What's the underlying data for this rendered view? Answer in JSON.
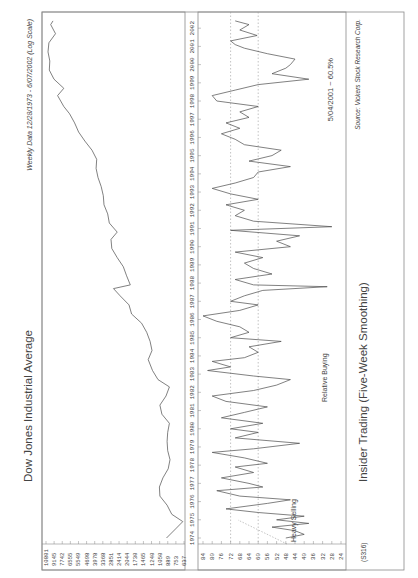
{
  "header": {
    "range_text": "Weekly Data 12/28/1973 - 6/07/2002 (Log Scale)",
    "source_text": "Source: Vickers Stock Research Corp.",
    "chart_code": "(S316)"
  },
  "colors": {
    "line": "#4a4a4a",
    "frame": "#8a8a8a",
    "grid": "#9a9a9a",
    "text": "#444444"
  },
  "chart_data": [
    {
      "type": "line",
      "title": "Dow Jones Industrial Average",
      "subtitle": "Weekly Data 12/28/1973 - 6/07/2002 (Log Scale)",
      "xlabel": "",
      "ylabel": "",
      "scale": "log",
      "ylim": [
        637,
        10801
      ],
      "y_ticks": [
        10801,
        9145,
        7742,
        6555,
        5549,
        4698,
        3978,
        3368,
        2851,
        2414,
        2044,
        1730,
        1465,
        1240,
        1050,
        889,
        753,
        637
      ],
      "x_ticks": [
        "1974",
        "1975",
        "1976",
        "1977",
        "1978",
        "1979",
        "1980",
        "1981",
        "1982",
        "1983",
        "1984",
        "1985",
        "1986",
        "1987",
        "1988",
        "1989",
        "1990",
        "1991",
        "1992",
        "1993",
        "1994",
        "1995",
        "1996",
        "1997",
        "1998",
        "1999",
        "2000",
        "2001",
        "2002"
      ],
      "series": [
        {
          "name": "DJIA",
          "x": [
            1974.0,
            1974.5,
            1974.9,
            1975.3,
            1975.8,
            1976.3,
            1976.8,
            1977.3,
            1977.8,
            1978.3,
            1978.8,
            1979.3,
            1979.8,
            1980.3,
            1980.8,
            1981.3,
            1981.8,
            1982.3,
            1982.7,
            1983.2,
            1983.8,
            1984.3,
            1984.8,
            1985.3,
            1985.8,
            1986.3,
            1986.8,
            1987.3,
            1987.7,
            1987.9,
            1988.4,
            1988.9,
            1989.4,
            1989.9,
            1990.4,
            1990.8,
            1991.3,
            1991.8,
            1992.3,
            1992.8,
            1993.3,
            1993.8,
            1994.3,
            1994.8,
            1995.3,
            1995.8,
            1996.3,
            1996.8,
            1997.3,
            1997.7,
            1998.3,
            1998.7,
            1999.2,
            1999.7,
            2000.2,
            2000.7,
            2001.2,
            2001.7,
            2002.2,
            2002.4
          ],
          "values": [
            850,
            700,
            600,
            760,
            840,
            980,
            990,
            920,
            820,
            790,
            830,
            840,
            830,
            800,
            940,
            980,
            860,
            800,
            1020,
            1150,
            1260,
            1160,
            1210,
            1300,
            1450,
            1800,
            1900,
            2300,
            2650,
            1850,
            2000,
            2150,
            2450,
            2750,
            2800,
            2450,
            2900,
            3000,
            3250,
            3300,
            3450,
            3700,
            3850,
            3800,
            4200,
            4900,
            5600,
            6100,
            6800,
            7700,
            8800,
            7700,
            9500,
            10500,
            10400,
            10800,
            10600,
            9200,
            10200,
            9700
          ]
        }
      ]
    },
    {
      "type": "line",
      "title": "Insider Trading (Five-Week Smoothing)",
      "xlabel": "",
      "ylabel": "",
      "ylim": [
        24,
        84
      ],
      "y_ticks": [
        84,
        80,
        76,
        72,
        68,
        64,
        60,
        56,
        52,
        48,
        44,
        40,
        36,
        32,
        28,
        24
      ],
      "reference_lines": [
        72,
        60
      ],
      "annotations": [
        "Heavy Selling",
        "Relative Buying",
        "5/04/2001 ~ 60.5%"
      ],
      "x_ticks": [
        "1974",
        "1975",
        "1976",
        "1977",
        "1978",
        "1979",
        "1980",
        "1981",
        "1982",
        "1983",
        "1984",
        "1985",
        "1986",
        "1987",
        "1988",
        "1989",
        "1990",
        "1991",
        "1992",
        "1993",
        "1994",
        "1995",
        "1996",
        "1997",
        "1998",
        "1999",
        "2000",
        "2001",
        "2002"
      ],
      "series": [
        {
          "name": "Insider Ratio",
          "x": [
            1974.0,
            1974.2,
            1974.4,
            1974.6,
            1974.8,
            1975.0,
            1975.2,
            1975.4,
            1975.6,
            1975.9,
            1976.1,
            1976.3,
            1976.6,
            1976.8,
            1977.0,
            1977.3,
            1977.6,
            1977.9,
            1978.1,
            1978.4,
            1978.7,
            1978.9,
            1979.2,
            1979.5,
            1979.8,
            1980.0,
            1980.3,
            1980.6,
            1980.9,
            1981.2,
            1981.5,
            1981.8,
            1982.1,
            1982.4,
            1982.7,
            1982.9,
            1983.2,
            1983.4,
            1983.7,
            1983.9,
            1984.2,
            1984.5,
            1984.8,
            1985.0,
            1985.3,
            1985.6,
            1985.9,
            1986.2,
            1986.5,
            1986.8,
            1987.0,
            1987.3,
            1987.6,
            1987.8,
            1987.9,
            1988.2,
            1988.5,
            1988.8,
            1989.1,
            1989.4,
            1989.7,
            1990.0,
            1990.3,
            1990.6,
            1990.9,
            1991.1,
            1991.4,
            1991.7,
            1992.0,
            1992.3,
            1992.6,
            1992.9,
            1993.2,
            1993.5,
            1993.8,
            1994.1,
            1994.4,
            1994.7,
            1995.0,
            1995.3,
            1995.6,
            1995.9,
            1996.2,
            1996.5,
            1996.8,
            1997.1,
            1997.4,
            1997.7,
            1998.0,
            1998.3,
            1998.6,
            1998.9,
            1999.2,
            1999.5,
            1999.8,
            2000.0,
            2000.3,
            2000.6,
            2000.9,
            2001.1,
            2001.3,
            2001.6,
            2001.9,
            2002.2,
            2002.4
          ],
          "values": [
            48,
            40,
            44,
            54,
            38,
            52,
            40,
            60,
            74,
            56,
            46,
            68,
            78,
            58,
            64,
            76,
            62,
            70,
            56,
            66,
            80,
            62,
            42,
            70,
            60,
            72,
            58,
            76,
            66,
            56,
            74,
            80,
            62,
            52,
            46,
            62,
            82,
            72,
            80,
            66,
            60,
            64,
            50,
            72,
            64,
            68,
            78,
            84,
            68,
            60,
            72,
            66,
            58,
            30,
            62,
            70,
            54,
            62,
            66,
            58,
            70,
            46,
            52,
            42,
            72,
            28,
            62,
            70,
            66,
            74,
            60,
            72,
            80,
            70,
            62,
            60,
            46,
            64,
            54,
            50,
            66,
            70,
            76,
            68,
            74,
            64,
            68,
            60,
            78,
            80,
            70,
            60,
            38,
            54,
            48,
            46,
            44,
            56,
            66,
            70,
            72,
            60.5,
            68,
            64,
            70
          ]
        }
      ]
    }
  ]
}
